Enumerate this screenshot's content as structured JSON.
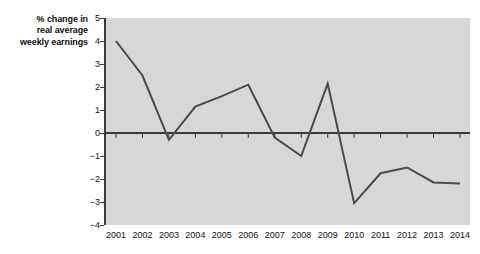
{
  "chart_data": {
    "type": "line",
    "title": "",
    "xlabel": "",
    "ylabel": "% change in real average weekly earnings",
    "ylabel_lines": [
      "% change in",
      "real average",
      "weekly earnings"
    ],
    "categories": [
      "2001",
      "2002",
      "2003",
      "2004",
      "2005",
      "2006",
      "2007",
      "2008",
      "2009",
      "2010",
      "2011",
      "2012",
      "2013",
      "2014"
    ],
    "values": [
      4.0,
      2.5,
      -0.3,
      1.15,
      1.6,
      2.1,
      -0.2,
      -1.0,
      2.15,
      -3.05,
      -1.75,
      -1.5,
      -2.15,
      -2.2
    ],
    "series": [
      {
        "name": "% change in real average weekly earnings",
        "values": [
          4.0,
          2.5,
          -0.3,
          1.15,
          1.6,
          2.1,
          -0.2,
          -1.0,
          2.15,
          -3.05,
          -1.75,
          -1.5,
          -2.15,
          -2.2
        ]
      }
    ],
    "x": [
      2001,
      2002,
      2003,
      2004,
      2005,
      2006,
      2007,
      2008,
      2009,
      2010,
      2011,
      2012,
      2013,
      2014
    ],
    "ylim": [
      -4,
      5
    ],
    "xlim": [
      2001,
      2014
    ],
    "y_ticks": [
      "5",
      "4",
      "3",
      "2",
      "1",
      "0",
      "−1",
      "−2",
      "−3",
      "−4"
    ],
    "y_tick_values": [
      5,
      4,
      3,
      2,
      1,
      0,
      -1,
      -2,
      -3,
      -4
    ],
    "grid": false,
    "legend": false,
    "legend_position": "none",
    "zero_line": true,
    "plot_background": "#d7d7d7",
    "line_color": "#4a4a4a",
    "axis_color": "#3b3b3b",
    "text_color": "#111111"
  },
  "caption": {
    "cropped_text": "partial text cut off at bottom edge"
  }
}
